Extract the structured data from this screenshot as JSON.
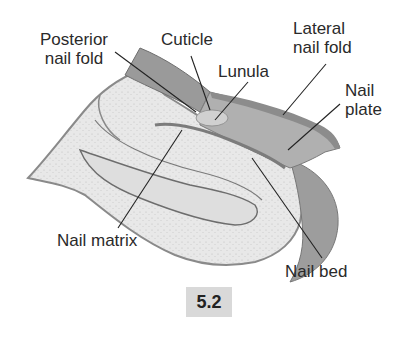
{
  "figure": {
    "number": "5.2",
    "labels": {
      "posterior_nail_fold": [
        "Posterior",
        "nail fold"
      ],
      "cuticle": "Cuticle",
      "lunula": "Lunula",
      "lateral_nail_fold": [
        "Lateral",
        "nail fold"
      ],
      "nail_plate": [
        "Nail",
        "plate"
      ],
      "nail_matrix": "Nail matrix",
      "nail_bed": "Nail bed"
    },
    "colors": {
      "nail_plate": "#a9a9a9",
      "nail_fold": "#8f8f8f",
      "tissue": "#e6e6e6",
      "leader_line": "#222222",
      "badge_bg": "#d9d9d9"
    }
  }
}
